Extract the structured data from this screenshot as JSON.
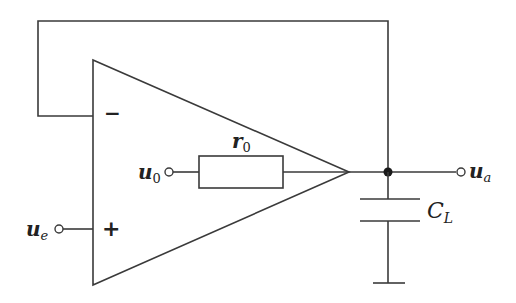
{
  "diagram": {
    "type": "circuit",
    "title": "",
    "components": {
      "opamp": {
        "inverting_sign": "−",
        "noninverting_sign": "+"
      },
      "resistor": {
        "label_main": "r",
        "label_sub": "0"
      },
      "capacitor": {
        "label_main": "C",
        "label_sub": "L"
      }
    },
    "terminals": {
      "input_e": {
        "label_main": "u",
        "label_sub": "e"
      },
      "input_0": {
        "label_main": "u",
        "label_sub": "0"
      },
      "output_a": {
        "label_main": "u",
        "label_sub": "a"
      }
    },
    "connections": [
      "output node fed back to inverting (−) input",
      "u_e to non-inverting (+) input",
      "u_0 through r_0 to amplifier output",
      "C_L from output node to ground"
    ],
    "colors": {
      "line": "#3a3a3a",
      "background": "#ffffff"
    }
  }
}
